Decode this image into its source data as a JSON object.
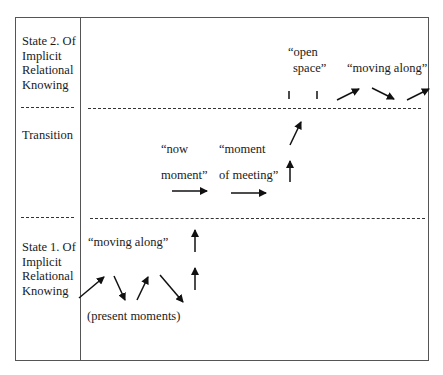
{
  "diagram": {
    "left_column": {
      "state2": [
        "State 2. Of",
        "Implicit",
        "Relational",
        "Knowing"
      ],
      "transition": "Transition",
      "state1": [
        "State 1. Of",
        "Implicit",
        "Relational",
        "Knowing"
      ]
    },
    "labels": {
      "moving_along_bottom": "“moving along”",
      "present_moments": "(present moments)",
      "now_moment_1": "“now",
      "now_moment_2": "moment”",
      "moment_meeting_1": "“moment",
      "moment_meeting_2": "of meeting”",
      "open_space_1": "“open",
      "open_space_2": "space”",
      "moving_along_top": "“moving along”"
    },
    "colors": {
      "line": "#333333",
      "frame": "#555555",
      "text": "#1a1a1a"
    }
  }
}
